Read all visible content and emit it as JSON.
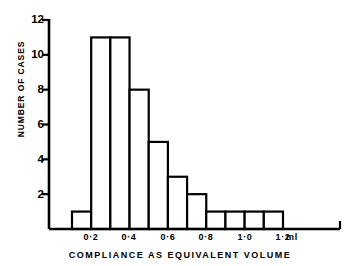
{
  "chart_data": {
    "type": "bar",
    "title": "",
    "xlabel": "COMPLIANCE AS EQUIVALENT VOLUME",
    "ylabel": "NUMBER OF CASES",
    "unit_label": "ml",
    "categories": [
      "0.0-0.1",
      "0.1-0.2",
      "0.2-0.3",
      "0.3-0.4",
      "0.4-0.5",
      "0.5-0.6",
      "0.6-0.7",
      "0.7-0.8",
      "0.8-0.9",
      "0.9-1.0",
      "1.0-1.1"
    ],
    "bin_edges": [
      0.1,
      0.2,
      0.3,
      0.4,
      0.5,
      0.6,
      0.7,
      0.8,
      0.9,
      1.0,
      1.1,
      1.2
    ],
    "values": [
      1,
      11,
      11,
      8,
      5,
      3,
      2,
      1,
      1,
      1,
      1
    ],
    "xtick_labels": [
      "0·2",
      "0·4",
      "0·6",
      "0·8",
      "1·0",
      "1·2"
    ],
    "xtick_values": [
      0.2,
      0.4,
      0.6,
      0.8,
      1.0,
      1.2
    ],
    "ytick_labels": [
      "12",
      "10",
      "8",
      "6",
      "4",
      "2"
    ],
    "ytick_values": [
      12,
      10,
      8,
      6,
      4,
      2
    ],
    "ylim": [
      0,
      12
    ],
    "xlim": [
      0.05,
      1.35
    ],
    "grid": false,
    "legend": null,
    "bar_fill": "#ffffff",
    "bar_edge": "#000000",
    "axis_color": "#000000",
    "background": "#ffffff"
  }
}
